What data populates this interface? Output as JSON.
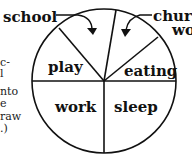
{
  "diagram": {
    "type": "pie-diagram",
    "segments": [
      {
        "label": "play"
      },
      {
        "label": "school"
      },
      {
        "label": "church work"
      },
      {
        "label": "eating"
      },
      {
        "label": "sleep"
      },
      {
        "label": "work"
      }
    ],
    "callouts": {
      "school": "school",
      "church_line1": "chur",
      "church_line2": "wo"
    }
  },
  "side_text": [
    "c-",
    "l",
    "nto",
    "e",
    "raw",
    ".)"
  ]
}
